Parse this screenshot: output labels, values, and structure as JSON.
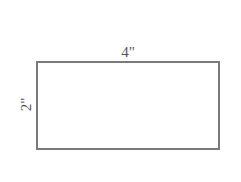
{
  "diagram": {
    "shape": "rectangle",
    "width_label": "4\"",
    "height_label": "2\"",
    "stroke_color": "#7a7a7a",
    "label_color": "#555555"
  }
}
